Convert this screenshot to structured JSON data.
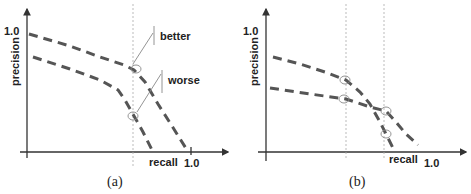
{
  "figure": {
    "panels": [
      {
        "id": "a",
        "caption": "(a)",
        "y_axis_label": "precision",
        "y_tick_label": "1.0",
        "x_axis_label": "recall",
        "x_tick_label": "1.0",
        "annotations": {
          "upper_label": "better",
          "lower_label": "worse"
        },
        "curves": [
          {
            "name": "upper-curve",
            "description": "higher precision-recall curve"
          },
          {
            "name": "lower-curve",
            "description": "lower precision-recall curve"
          }
        ],
        "guide_lines": 1,
        "marked_points": 2
      },
      {
        "id": "b",
        "caption": "(b)",
        "y_axis_label": "precision",
        "y_tick_label": "1.0",
        "x_axis_label": "recall",
        "x_tick_label": "1.0",
        "curves": [
          {
            "name": "steep-curve",
            "description": "starts higher, drops steeply"
          },
          {
            "name": "flat-curve",
            "description": "starts lower, declines gradually, crosses steep curve"
          }
        ],
        "guide_lines": 2,
        "marked_points": 4
      }
    ],
    "colors": {
      "axis": "#333333",
      "curve": "#555555",
      "guide": "#aaaaaa",
      "text": "#222222"
    }
  }
}
